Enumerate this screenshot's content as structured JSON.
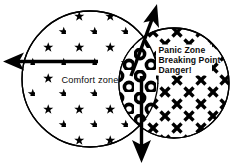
{
  "diagram": {
    "background_color": "#ffffff",
    "ink_color": "#000000",
    "left_circle": {
      "name": "comfort-zone-circle",
      "label": "Comfort zone",
      "fill_pattern": "stars",
      "pattern_icon": "star-icon",
      "cx": 90,
      "cy": 79,
      "r": 68,
      "label_x": 62,
      "label_y": 82
    },
    "overlap_region": {
      "name": "overlap-lens",
      "label": "",
      "fill_pattern": "rings",
      "pattern_icon": "ring-icon"
    },
    "right_circle": {
      "name": "panic-zone-circle",
      "fill_pattern": "crosses",
      "pattern_icon": "cross-x-icon",
      "cx": 174,
      "cy": 83,
      "r": 55,
      "label_lines": [
        "Panic Zone",
        "Breaking Point",
        "Danger!"
      ],
      "label_x": 159,
      "label_y": 53,
      "line_height": 10
    },
    "arrows": [
      {
        "name": "arrow-left",
        "direction": "left",
        "description": "bold arrow pointing left out of the comfort zone",
        "x1": 98,
        "y1": 61,
        "x2": 6,
        "y2": 61
      },
      {
        "name": "arrow-up-right",
        "direction": "up-right",
        "description": "bold arrow pointing up and to the right out of the overlap",
        "x1": 132,
        "y1": 74,
        "x2": 157,
        "y2": 5
      },
      {
        "name": "arrow-down",
        "direction": "down",
        "description": "bold arrow pointing down out of the overlap",
        "x1": 142,
        "y1": 76,
        "x2": 142,
        "y2": 163
      }
    ]
  }
}
